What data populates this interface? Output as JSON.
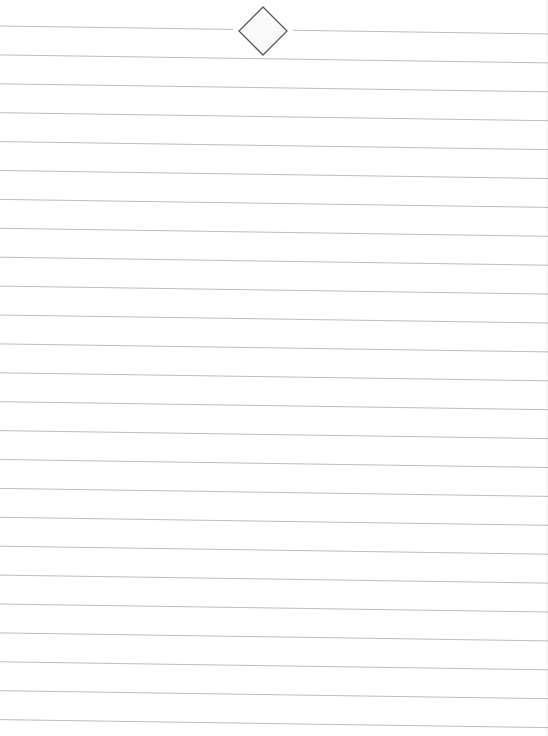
{
  "page": {
    "type": "lined-paper",
    "width": 548,
    "height": 736,
    "background_color": "#ffffff"
  },
  "rules": {
    "count": 25,
    "first_line_y_left": 26,
    "spacing": 28.9,
    "slant_px_across_width": 8,
    "color": "#bdbdbd",
    "thickness": 1
  },
  "ornament": {
    "shape": "diamond",
    "center_x": 263,
    "center_y": 31,
    "half_size": 24,
    "stroke_color": "#5a5a5a",
    "fill_color": "#f4f4f4",
    "line_gap": [
      233,
      293
    ]
  }
}
